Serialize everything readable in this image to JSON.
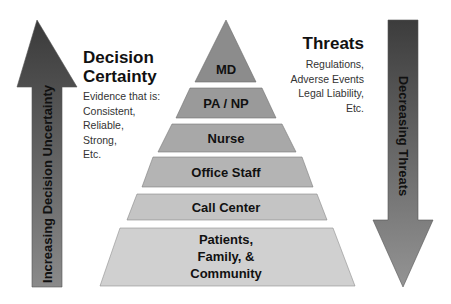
{
  "left_panel": {
    "heading_line1": "Decision",
    "heading_line2": "Certainty",
    "evidence_lines": [
      "Evidence that is:",
      "Consistent,",
      "Reliable,",
      "Strong,",
      "Etc."
    ]
  },
  "right_panel": {
    "heading": "Threats",
    "threat_lines": [
      "Regulations,",
      "Adverse Events",
      "Legal Liability,",
      "Etc."
    ]
  },
  "arrows": {
    "left": {
      "direction": "up",
      "label": "Increasing Decision Uncertainty"
    },
    "right": {
      "direction": "down",
      "label": "Decreasing Threats"
    }
  },
  "pyramid": {
    "tiers": [
      {
        "label": "MD",
        "fill": "#8c8c8c"
      },
      {
        "label": "PA / NP",
        "fill": "#9a9a9a"
      },
      {
        "label": "Nurse",
        "fill": "#a8a8a8"
      },
      {
        "label": "Office Staff",
        "fill": "#b4b4b4"
      },
      {
        "label": "Call Center",
        "fill": "#c4c4c4"
      },
      {
        "label_lines": [
          "Patients,",
          "Family, &",
          "Community"
        ],
        "fill": "#d0d0d0"
      }
    ]
  },
  "colors": {
    "arrow_dark": "#3a3a3a",
    "arrow_light": "#8a8a8a",
    "text": "#111111"
  }
}
